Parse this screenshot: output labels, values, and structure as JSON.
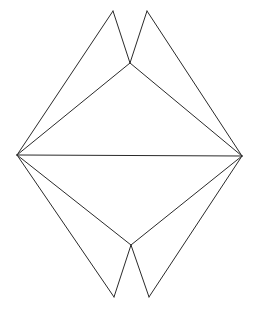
{
  "canvas": {
    "width": 259,
    "height": 315,
    "background_color": "#ffffff"
  },
  "figure": {
    "name": "double-notched-kite-polygon",
    "stroke_color": "#2a2a2a",
    "stroke_width": 1,
    "fill": "none",
    "symmetry": "bilateral-vertical"
  },
  "vertices": [
    {
      "id": "top-left-peak",
      "x": 113,
      "y": 11
    },
    {
      "id": "top-right-peak",
      "x": 147,
      "y": 11
    },
    {
      "id": "top-notch",
      "x": 130,
      "y": 63
    },
    {
      "id": "left-vertex",
      "x": 17,
      "y": 155
    },
    {
      "id": "right-vertex",
      "x": 242,
      "y": 156
    },
    {
      "id": "bottom-notch",
      "x": 131,
      "y": 245
    },
    {
      "id": "bottom-left-point",
      "x": 114,
      "y": 297
    },
    {
      "id": "bottom-right-point",
      "x": 149,
      "y": 297
    }
  ],
  "edges": [
    {
      "id": "edge-left-to-top-left-peak",
      "from": "left-vertex",
      "to": "top-left-peak",
      "path": "M 17 155 L 113 11"
    },
    {
      "id": "edge-top-left-peak-to-top-notch",
      "from": "top-left-peak",
      "to": "top-notch",
      "path": "M 113 11 L 130 63"
    },
    {
      "id": "edge-top-notch-to-top-right-peak",
      "from": "top-notch",
      "to": "top-right-peak",
      "path": "M 130 63 L 147 11"
    },
    {
      "id": "edge-top-right-peak-to-right",
      "from": "top-right-peak",
      "to": "right-vertex",
      "path": "M 147 11 L 242 156"
    },
    {
      "id": "edge-left-to-top-notch",
      "from": "left-vertex",
      "to": "top-notch",
      "path": "M 17 155 L 130 63"
    },
    {
      "id": "edge-top-notch-to-right",
      "from": "top-notch",
      "to": "right-vertex",
      "path": "M 130 63 L 242 156"
    },
    {
      "id": "edge-horizontal-axis",
      "from": "left-vertex",
      "to": "right-vertex",
      "path": "M 17 155 L 242 156"
    },
    {
      "id": "edge-left-to-bottom-left-point",
      "from": "left-vertex",
      "to": "bottom-left-point",
      "path": "M 17 155 L 114 297"
    },
    {
      "id": "edge-bottom-left-point-to-notch",
      "from": "bottom-left-point",
      "to": "bottom-notch",
      "path": "M 114 297 L 131 245"
    },
    {
      "id": "edge-bottom-notch-to-right-point",
      "from": "bottom-notch",
      "to": "bottom-right-point",
      "path": "M 131 245 L 149 297"
    },
    {
      "id": "edge-bottom-right-point-to-right",
      "from": "bottom-right-point",
      "to": "right-vertex",
      "path": "M 149 297 L 242 156"
    },
    {
      "id": "edge-left-to-bottom-notch",
      "from": "left-vertex",
      "to": "bottom-notch",
      "path": "M 17 155 L 131 245"
    },
    {
      "id": "edge-bottom-notch-to-right-vertex",
      "from": "bottom-notch",
      "to": "right-vertex",
      "path": "M 131 245 L 242 156"
    }
  ]
}
